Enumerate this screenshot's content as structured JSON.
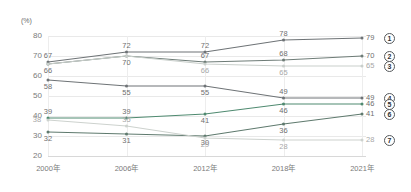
{
  "chart_data": {
    "type": "line",
    "title": "",
    "xlabel": "",
    "ylabel": "(%)",
    "ylim": [
      20,
      80
    ],
    "yticks": [
      20,
      30,
      40,
      50,
      60,
      70,
      80
    ],
    "grid": true,
    "legend_position": "right",
    "categories": [
      "2000年",
      "2006年",
      "2012年",
      "2018年",
      "2021年"
    ],
    "series": [
      {
        "name": "①",
        "legend": "1",
        "color": "#6e7376",
        "values": [
          67,
          72,
          72,
          78,
          79
        ],
        "labels": [
          "67",
          "72",
          "72",
          "78",
          "79"
        ]
      },
      {
        "name": "②",
        "legend": "2",
        "color": "#6e7c77",
        "values": [
          66,
          70,
          67,
          68,
          70
        ],
        "labels": [
          "66",
          "70",
          "67",
          "68",
          "70"
        ]
      },
      {
        "name": "③",
        "legend": "3",
        "color": "#c9cfcb",
        "values": [
          66,
          70,
          66,
          65,
          65
        ],
        "labels": [
          "",
          "",
          "66",
          "65",
          "65"
        ]
      },
      {
        "name": "④",
        "legend": "4",
        "color": "#6e7376",
        "values": [
          58,
          55,
          55,
          49,
          49
        ],
        "labels": [
          "58",
          "55",
          "55",
          "49",
          "49"
        ]
      },
      {
        "name": "⑤",
        "legend": "5",
        "color": "#4f8a70",
        "values": [
          39,
          39,
          41,
          46,
          46
        ],
        "labels": [
          "39",
          "39",
          "41",
          "46",
          "46"
        ]
      },
      {
        "name": "⑥",
        "legend": "6",
        "color": "#5f7a6e",
        "values": [
          32,
          31,
          30,
          36,
          41
        ],
        "labels": [
          "32",
          "31",
          "30",
          "36",
          "41"
        ]
      },
      {
        "name": "⑦",
        "legend": "7",
        "color": "#cdd2ce",
        "values": [
          38,
          35,
          29,
          28,
          28
        ],
        "labels": [
          "38",
          "35",
          "29",
          "28",
          "28"
        ]
      }
    ]
  },
  "axis": {
    "unit_label": "(%)",
    "ytick_labels": [
      "80",
      "70",
      "60",
      "50",
      "40",
      "30",
      "20"
    ],
    "xtick_labels": [
      "2000年",
      "2006年",
      "2012年",
      "2018年",
      "2021年"
    ]
  },
  "legend": {
    "items": [
      {
        "marker": "1",
        "value": "79"
      },
      {
        "marker": "2",
        "value": "70"
      },
      {
        "marker": "3",
        "value": "65"
      },
      {
        "marker": "4",
        "value": "49"
      },
      {
        "marker": "5",
        "value": "46"
      },
      {
        "marker": "6",
        "value": "41"
      },
      {
        "marker": "7",
        "value": "28"
      }
    ]
  }
}
